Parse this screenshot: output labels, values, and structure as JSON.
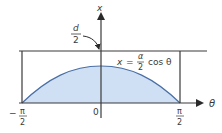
{
  "diagram": {
    "type": "needle-problem-integration-region",
    "colors": {
      "line": "#3a3a3a",
      "fill": "#cfe0f4",
      "curve": "#4a6fa5",
      "background": "#ffffff"
    },
    "vertical_axis": {
      "label": "x"
    },
    "horizontal_axis": {
      "label": "θ"
    },
    "top_line_label": {
      "numerator": "d",
      "denominator": "2"
    },
    "curve_label": {
      "lhs": "x",
      "equals": "=",
      "numerator": "α",
      "denominator": "2",
      "func": "cos θ"
    },
    "ticks": {
      "left": {
        "sign": "−",
        "numerator": "π",
        "denominator": "2"
      },
      "origin": "0",
      "right": {
        "numerator": "π",
        "denominator": "2"
      }
    }
  }
}
